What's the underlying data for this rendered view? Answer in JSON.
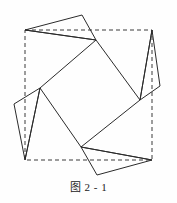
{
  "figure": {
    "caption": "图 2 - 1",
    "colors": {
      "stroke": "#2b2b2b",
      "dashed_stroke": "#3a3a3a",
      "background": "#fefefe"
    },
    "stroke_width": 1,
    "dash_pattern": "4,3",
    "outer_square": {
      "label": "dashed-reference-square",
      "points": [
        [
          25,
          30
        ],
        [
          152,
          30
        ],
        [
          152,
          160
        ],
        [
          25,
          160
        ]
      ]
    },
    "inner_square": {
      "label": "inner-tilted-square",
      "points": [
        [
          96,
          40
        ],
        [
          140,
          100
        ],
        [
          81,
          147
        ],
        [
          40,
          88
        ]
      ]
    },
    "triangles": [
      {
        "name": "triangle-top",
        "points": [
          [
            25,
            30
          ],
          [
            96,
            40
          ],
          [
            82,
            15
          ]
        ]
      },
      {
        "name": "triangle-right",
        "points": [
          [
            152,
            30
          ],
          [
            140,
            100
          ],
          [
            160,
            86
          ]
        ]
      },
      {
        "name": "triangle-bottom",
        "points": [
          [
            152,
            160
          ],
          [
            81,
            147
          ],
          [
            97,
            175
          ]
        ]
      },
      {
        "name": "triangle-left",
        "points": [
          [
            25,
            160
          ],
          [
            40,
            88
          ],
          [
            14,
            104
          ]
        ]
      }
    ],
    "spokes": [
      {
        "name": "spoke-top-left",
        "from": [
          25,
          30
        ],
        "to": [
          96,
          40
        ]
      },
      {
        "name": "spoke-top-right",
        "from": [
          152,
          30
        ],
        "to": [
          140,
          100
        ]
      },
      {
        "name": "spoke-bottom-right",
        "from": [
          152,
          160
        ],
        "to": [
          81,
          147
        ]
      },
      {
        "name": "spoke-bottom-left",
        "from": [
          25,
          160
        ],
        "to": [
          40,
          88
        ]
      }
    ]
  }
}
